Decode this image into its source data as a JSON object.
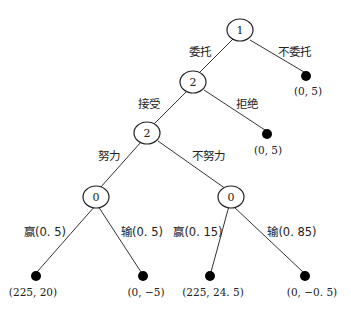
{
  "diagram": {
    "type": "game-tree",
    "nodes": [
      {
        "id": "n1",
        "kind": "decision",
        "player": "1"
      },
      {
        "id": "n2a",
        "kind": "decision",
        "player": "2"
      },
      {
        "id": "n2b",
        "kind": "decision",
        "player": "2"
      },
      {
        "id": "c1",
        "kind": "chance",
        "player": "0"
      },
      {
        "id": "c2",
        "kind": "chance",
        "player": "0"
      },
      {
        "id": "t1",
        "kind": "terminal",
        "payoff": "(0, 5)"
      },
      {
        "id": "t2",
        "kind": "terminal",
        "payoff": "(0, 5)"
      },
      {
        "id": "t3",
        "kind": "terminal",
        "payoff": "(225, 20)"
      },
      {
        "id": "t4",
        "kind": "terminal",
        "payoff": "(0, −5)"
      },
      {
        "id": "t5",
        "kind": "terminal",
        "payoff": "(225, 24. 5)"
      },
      {
        "id": "t6",
        "kind": "terminal",
        "payoff": "(0, −0. 5)"
      }
    ],
    "edges": [
      {
        "from": "n1",
        "to": "n2a",
        "label": "委托"
      },
      {
        "from": "n1",
        "to": "t1",
        "label": "不委托"
      },
      {
        "from": "n2a",
        "to": "n2b",
        "label": "接受"
      },
      {
        "from": "n2a",
        "to": "t2",
        "label": "拒绝"
      },
      {
        "from": "n2b",
        "to": "c1",
        "label": "努力"
      },
      {
        "from": "n2b",
        "to": "c2",
        "label": "不努力"
      },
      {
        "from": "c1",
        "to": "t3",
        "label": "赢(0. 5)"
      },
      {
        "from": "c1",
        "to": "t4",
        "label": "输(0. 5)"
      },
      {
        "from": "c2",
        "to": "t5",
        "label": "赢(0. 15)"
      },
      {
        "from": "c2",
        "to": "t6",
        "label": "输(0. 85)"
      }
    ]
  }
}
